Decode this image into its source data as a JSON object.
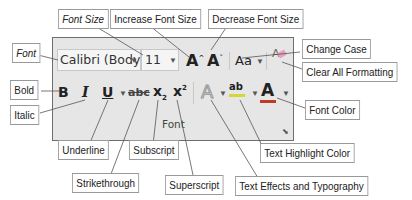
{
  "ribbon_group": {
    "name": "Font",
    "font_name_value": "Calibri (Body)",
    "font_size_value": "11",
    "buttons": {
      "increase_font_size": "A",
      "decrease_font_size": "A",
      "change_case": "Aa",
      "clear_formatting": "A",
      "bold": "B",
      "italic": "I",
      "underline": "U",
      "strikethrough": "abc",
      "subscript": "x",
      "superscript": "x",
      "text_effects": "A",
      "highlight": "ab",
      "font_color": "A"
    },
    "colors": {
      "panel_bg": "#e6e6e6",
      "font_color_bar": "#c0392b",
      "highlight_bar": "#d6d63a"
    }
  },
  "callouts": {
    "font_size": "Font Size",
    "increase_font_size": "Increase Font Size",
    "decrease_font_size": "Decrease Font Size",
    "font": "Font",
    "change_case": "Change Case",
    "clear_all_formatting": "Clear All Formatting",
    "bold": "Bold",
    "italic": "Italic",
    "font_color": "Font Color",
    "underline": "Underline",
    "subscript": "Subscript",
    "text_highlight_color": "Text Highlight Color",
    "strikethrough": "Strikethrough",
    "superscript": "Superscript",
    "text_effects": "Text Effects and Typography"
  }
}
